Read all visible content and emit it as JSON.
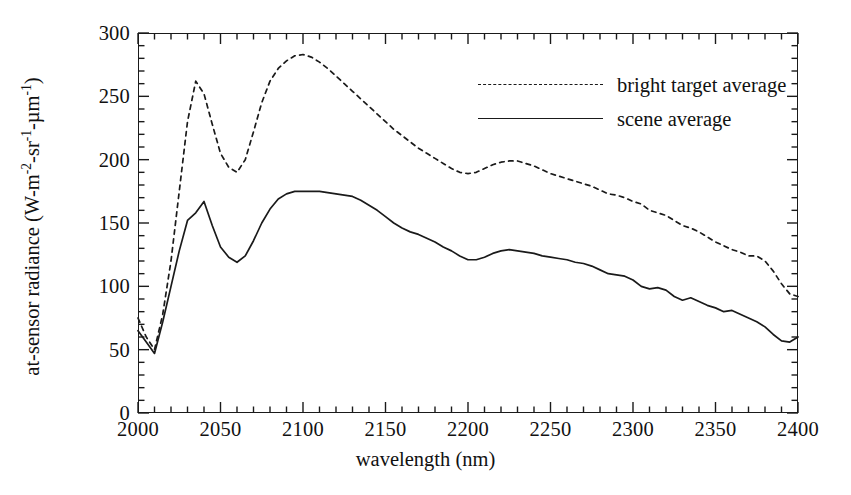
{
  "chart_data": {
    "type": "line",
    "title": "",
    "xlabel": "wavelength (nm)",
    "ylabel_parts": {
      "lead": "at-sensor radiance (W-m",
      "exp1": "-2",
      "mid1": "-sr",
      "exp2": "-1",
      "mid2": "-µm",
      "exp3": "-1",
      "tail": ")"
    },
    "ylabel": "at-sensor radiance (W-m-2 -sr-1 -µm-1)",
    "xlim": [
      2000,
      2400
    ],
    "ylim": [
      0,
      300
    ],
    "xticks": [
      2000,
      2050,
      2100,
      2150,
      2200,
      2250,
      2300,
      2350,
      2400
    ],
    "xtick_labels": [
      "2000",
      "2050",
      "2100",
      "2150",
      "2200",
      "2250",
      "2300",
      "2350",
      "2400"
    ],
    "x_minor_step": 10,
    "yticks": [
      0,
      50,
      100,
      150,
      200,
      250,
      300
    ],
    "ytick_labels": [
      "0",
      "50",
      "100",
      "150",
      "200",
      "250",
      "300"
    ],
    "y_minor_step": 10,
    "grid": false,
    "legend_position": "upper-right-inside",
    "series": [
      {
        "name": "bright target average",
        "style": "dashed",
        "color": "#1a1a1a",
        "x": [
          2000,
          2005,
          2010,
          2015,
          2020,
          2025,
          2030,
          2035,
          2040,
          2045,
          2050,
          2055,
          2060,
          2065,
          2070,
          2075,
          2080,
          2085,
          2090,
          2095,
          2100,
          2105,
          2110,
          2115,
          2120,
          2125,
          2130,
          2135,
          2140,
          2145,
          2150,
          2155,
          2160,
          2165,
          2170,
          2175,
          2180,
          2185,
          2190,
          2195,
          2200,
          2205,
          2210,
          2215,
          2220,
          2225,
          2230,
          2235,
          2240,
          2245,
          2250,
          2255,
          2260,
          2265,
          2270,
          2275,
          2280,
          2285,
          2290,
          2295,
          2300,
          2305,
          2310,
          2315,
          2320,
          2325,
          2330,
          2335,
          2340,
          2345,
          2350,
          2355,
          2360,
          2365,
          2370,
          2375,
          2380,
          2385,
          2390,
          2395,
          2400
        ],
        "y": [
          75,
          60,
          50,
          78,
          120,
          175,
          230,
          262,
          252,
          228,
          205,
          194,
          190,
          200,
          222,
          245,
          262,
          272,
          278,
          282,
          283,
          281,
          277,
          272,
          266,
          260,
          254,
          248,
          242,
          236,
          230,
          224,
          219,
          214,
          209,
          205,
          201,
          197,
          193,
          190,
          189,
          190,
          193,
          196,
          198,
          199,
          199,
          197,
          195,
          192,
          189,
          187,
          185,
          183,
          181,
          179,
          176,
          173,
          172,
          170,
          167,
          165,
          160,
          158,
          156,
          152,
          148,
          146,
          143,
          139,
          135,
          132,
          129,
          127,
          124,
          124,
          120,
          112,
          102,
          94,
          92
        ]
      },
      {
        "name": "scene average",
        "style": "solid",
        "color": "#1a1a1a",
        "x": [
          2000,
          2005,
          2010,
          2015,
          2020,
          2025,
          2030,
          2035,
          2040,
          2045,
          2050,
          2055,
          2060,
          2065,
          2070,
          2075,
          2080,
          2085,
          2090,
          2095,
          2100,
          2105,
          2110,
          2115,
          2120,
          2125,
          2130,
          2135,
          2140,
          2145,
          2150,
          2155,
          2160,
          2165,
          2170,
          2175,
          2180,
          2185,
          2190,
          2195,
          2200,
          2205,
          2210,
          2215,
          2220,
          2225,
          2230,
          2235,
          2240,
          2245,
          2250,
          2255,
          2260,
          2265,
          2270,
          2275,
          2280,
          2285,
          2290,
          2295,
          2300,
          2305,
          2310,
          2315,
          2320,
          2325,
          2330,
          2335,
          2340,
          2345,
          2350,
          2355,
          2360,
          2365,
          2370,
          2375,
          2380,
          2385,
          2390,
          2395,
          2400
        ],
        "y": [
          65,
          56,
          47,
          72,
          100,
          128,
          152,
          158,
          167,
          148,
          131,
          123,
          119,
          124,
          136,
          150,
          161,
          169,
          173,
          175,
          175,
          175,
          175,
          174,
          173,
          172,
          171,
          168,
          164,
          160,
          155,
          150,
          146,
          143,
          141,
          138,
          135,
          131,
          128,
          124,
          121,
          121,
          123,
          126,
          128,
          129,
          128,
          127,
          126,
          124,
          123,
          122,
          121,
          119,
          118,
          116,
          113,
          110,
          109,
          108,
          105,
          100,
          98,
          99,
          97,
          92,
          89,
          91,
          88,
          85,
          83,
          80,
          81,
          78,
          75,
          72,
          68,
          62,
          57,
          56,
          60
        ]
      }
    ]
  }
}
